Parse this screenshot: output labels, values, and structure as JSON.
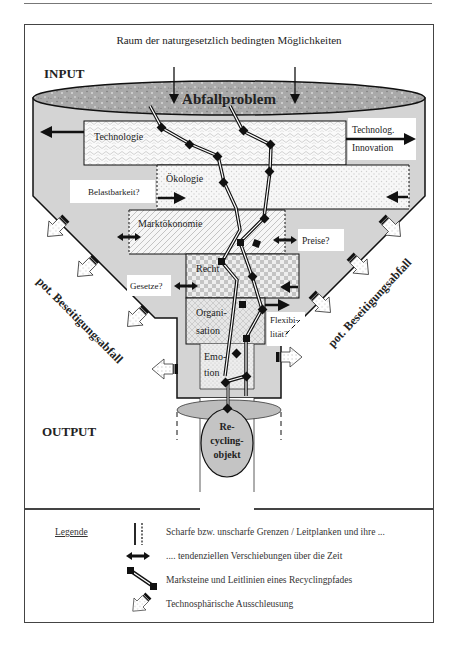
{
  "diagram": {
    "header": "Raum der naturgesetzlich bedingten Möglichkeiten",
    "input_label": "INPUT",
    "output_label": "OUTPUT",
    "funnel_top_label": "Abfallproblem",
    "layers": [
      {
        "id": "technologie",
        "label": "Technologie",
        "pattern": "wave-crosshatch"
      },
      {
        "id": "oekologie",
        "label": "Ökologie",
        "pattern": "dots"
      },
      {
        "id": "marktoekonomie",
        "label": "Marktökonomie",
        "pattern": "diagonal-hatch"
      },
      {
        "id": "recht",
        "label": "Recht",
        "pattern": "checkerboard"
      },
      {
        "id": "organisation",
        "label_line1": "Organi-",
        "label_line2": "sation",
        "pattern": "weave"
      },
      {
        "id": "emotion",
        "label_line1": "Emo-",
        "label_line2": "tion",
        "pattern": "fine-dots"
      }
    ],
    "side_labels": {
      "technolog_innovation_line1": "Technolog.",
      "technolog_innovation_line2": "Innovation",
      "belastbarkeit": "Belastbarkeit?",
      "preise": "Preise?",
      "gesetze": "Gesetze?",
      "flexibilitaet_line1": "Flexibi-",
      "flexibilitaet_line2": "lität?"
    },
    "waste_label_left": "pot. Beseitigungsabfall",
    "waste_label_right": "pot. Beseitigungsabfall",
    "output_object_line1": "Re-",
    "output_object_line2": "cycling-",
    "output_object_line3": "objekt",
    "colors": {
      "funnel_fill": "#d4d4d4",
      "top_ellipse": "#a8a8a8",
      "bottom_ellipse": "#bdbdbd",
      "layer_fill": "#f4f4f4",
      "line": "#111111"
    }
  },
  "legend": {
    "title": "Legende",
    "items": [
      {
        "icon": "boundary-lines-icon",
        "text": "Scharfe bzw. unscharfe Grenzen / Leitplanken und ihre ..."
      },
      {
        "icon": "double-arrow-icon",
        "text": ".... tendenziellen Verschiebungen über die Zeit"
      },
      {
        "icon": "path-milestone-icon",
        "text": "Marksteine und Leitlinien eines Recyclingpfades"
      },
      {
        "icon": "exit-arrow-icon",
        "text": "Technosphärische Ausschleusung"
      }
    ]
  }
}
